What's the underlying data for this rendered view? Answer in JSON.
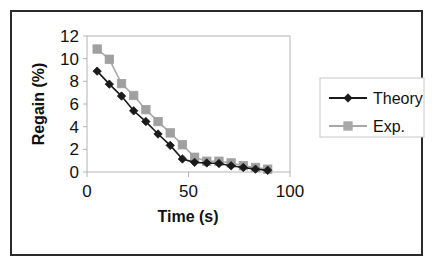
{
  "figure": {
    "background_color": "#ffffff",
    "frame_color": "#2b2b2b"
  },
  "chart_data": {
    "type": "line",
    "title": "",
    "subtitle": "",
    "xlabel": "Time (s)",
    "ylabel": "Regain (%)",
    "xlim": [
      0,
      100
    ],
    "ylim": [
      0,
      12
    ],
    "xticks": [
      0,
      50,
      100
    ],
    "xtick_labels": [
      "0",
      "50",
      "100"
    ],
    "yticks": [
      0,
      2,
      4,
      6,
      8,
      10,
      12
    ],
    "ytick_labels": [
      "0",
      "2",
      "4",
      "6",
      "8",
      "10",
      "12"
    ],
    "grid": false,
    "legend_position": "right-outside",
    "series": [
      {
        "name": "Theory",
        "color": "#1a1a1a",
        "marker": "diamond",
        "marker_color": "#1a1a1a",
        "x": [
          5,
          11,
          17,
          23,
          29,
          35,
          41,
          47,
          53,
          59,
          65,
          71,
          77,
          83,
          89
        ],
        "y": [
          8.9,
          7.75,
          6.7,
          5.4,
          4.45,
          3.35,
          2.35,
          1.15,
          0.85,
          0.8,
          0.75,
          0.55,
          0.4,
          0.25,
          0.15
        ]
      },
      {
        "name": "Exp.",
        "color": "#a8a8a8",
        "marker": "square",
        "marker_color": "#a0a0a0",
        "x": [
          5,
          11,
          17,
          23,
          29,
          35,
          41,
          47,
          53,
          59,
          65,
          71,
          77,
          83,
          89
        ],
        "y": [
          10.85,
          9.95,
          7.8,
          6.75,
          5.5,
          4.45,
          3.45,
          2.4,
          1.3,
          0.95,
          0.95,
          0.8,
          0.55,
          0.4,
          0.25
        ]
      }
    ],
    "legend": [
      {
        "label": "Theory",
        "color": "#1a1a1a",
        "marker": "diamond"
      },
      {
        "label": "Exp.",
        "color": "#a8a8a8",
        "marker": "square"
      }
    ]
  }
}
